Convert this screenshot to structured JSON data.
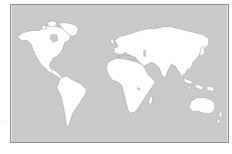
{
  "map": {
    "type": "world-outline",
    "projection": "equirectangular-like",
    "colors": {
      "ocean": "#c9c9c9",
      "land": "#ffffff",
      "coast": "#8a8a8a",
      "frame": "#8e8e8e",
      "background": "#ffffff"
    },
    "regions": [
      {
        "name": "north-america"
      },
      {
        "name": "greenland"
      },
      {
        "name": "south-america"
      },
      {
        "name": "europe-asia"
      },
      {
        "name": "africa"
      },
      {
        "name": "madagascar"
      },
      {
        "name": "australia"
      },
      {
        "name": "southeast-asia-islands"
      },
      {
        "name": "japan"
      },
      {
        "name": "new-zealand"
      },
      {
        "name": "british-isles"
      },
      {
        "name": "arctic-islands"
      }
    ]
  }
}
